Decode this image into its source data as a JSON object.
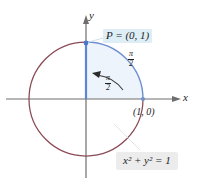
{
  "figure": {
    "axes": {
      "x_label": "x",
      "y_label": "y"
    },
    "labels": {
      "point_p": "P = (0, 1)",
      "point_one_zero": "(1, 0)",
      "equation": "x² + y² = 1",
      "arc_length_outer_numerator": "π",
      "arc_length_outer_denominator": "2",
      "angle_inner_numerator": "π",
      "angle_inner_denominator": "2"
    },
    "colors": {
      "circle_main": "#8a4a55",
      "arc_highlight": "#6f8fd0",
      "radius_segment": "#5d86d6",
      "axis": "#6e6e6e",
      "point_marker": "#4a78c8",
      "quadrant_fill": "#edf4fb",
      "p_label_background": "#ddeef6",
      "equation_background": "#ececed",
      "text": "#1d1d1d"
    },
    "geometry": {
      "center_x": 86,
      "center_y": 99,
      "radius": 57,
      "point_p_x": 86,
      "point_p_y": 43,
      "point_one_zero_x": 143,
      "point_one_zero_y": 99
    }
  }
}
